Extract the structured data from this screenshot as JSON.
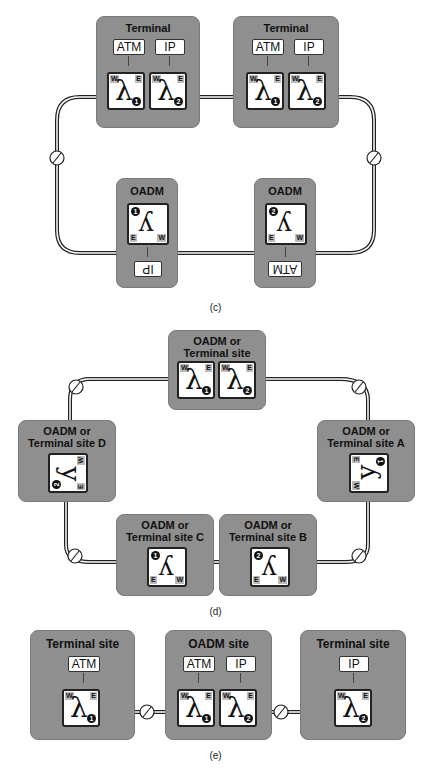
{
  "figure_c": {
    "caption": "(c)",
    "sites": [
      {
        "title": "Terminal",
        "clients": [
          "ATM",
          "IP"
        ],
        "channels": [
          "1",
          "2"
        ]
      },
      {
        "title": "Terminal",
        "clients": [
          "ATM",
          "IP"
        ],
        "channels": [
          "1",
          "2"
        ]
      },
      {
        "title": "OADM",
        "client": "IP",
        "channel": "1"
      },
      {
        "title": "OADM",
        "client": "ATM",
        "channel": "2"
      }
    ]
  },
  "figure_d": {
    "caption": "(d)",
    "sites": [
      {
        "title_line1": "OADM or",
        "title_line2": "Terminal site",
        "channels": [
          "1",
          "2"
        ]
      },
      {
        "title_line1": "OADM or",
        "title_line2": "Terminal site D",
        "channel": "2"
      },
      {
        "title_line1": "OADM or",
        "title_line2": "Terminal site A",
        "channel": "1"
      },
      {
        "title_line1": "OADM or",
        "title_line2": "Terminal site C",
        "channel": "1"
      },
      {
        "title_line1": "OADM or",
        "title_line2": "Terminal site B",
        "channel": "2"
      }
    ]
  },
  "figure_e": {
    "caption": "(e)",
    "sites": [
      {
        "title": "Terminal site",
        "clients": [
          "ATM"
        ],
        "channels": [
          "1"
        ]
      },
      {
        "title": "OADM site",
        "clients": [
          "ATM",
          "IP"
        ],
        "channels": [
          "1",
          "2"
        ]
      },
      {
        "title": "Terminal site",
        "clients": [
          "IP"
        ],
        "channels": [
          "2"
        ]
      }
    ]
  },
  "labels": {
    "lambda": "λ",
    "west": "W",
    "east": "E",
    "amp": "⌀"
  }
}
